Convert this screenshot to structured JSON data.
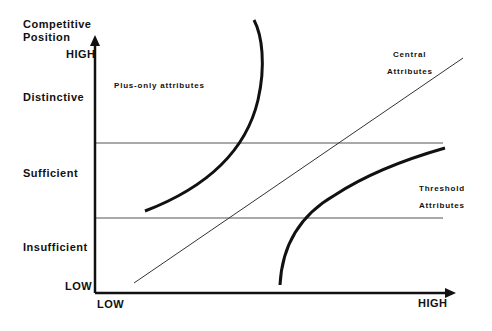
{
  "diagram": {
    "type": "conceptual-matrix",
    "y_axis": {
      "title_line1": "Competitive",
      "title_line2": "Position",
      "high": "HIGH",
      "low": "LOW",
      "bands": [
        "Distinctive",
        "Sufficient",
        "Insufficient"
      ]
    },
    "x_axis": {
      "low": "LOW",
      "high": "HIGH"
    },
    "regions": {
      "plus_only": "Plus-only attributes",
      "central_line1": "Central",
      "central_line2": "Attributes",
      "threshold_line1": "Threshold",
      "threshold_line2": "Attributes"
    },
    "colors": {
      "ink": "#111111",
      "gridline": "#555555",
      "background": "#ffffff"
    }
  }
}
